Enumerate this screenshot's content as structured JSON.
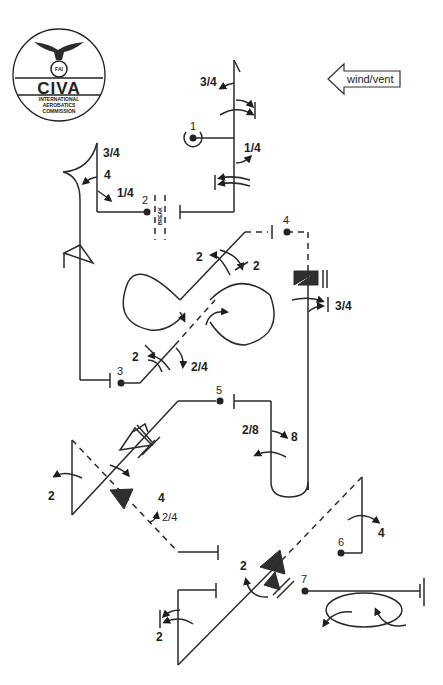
{
  "logo": {
    "title": "CIVA",
    "subtitle_lines": [
      "INTERNATIONAL",
      "AEROBATICS",
      "COMMISSION"
    ],
    "emblem": "FAI"
  },
  "wind_indicator": {
    "label": "wind/vent",
    "direction": "left"
  },
  "figures": [
    {
      "number": "1",
      "rolls": [
        "3/4",
        "1/4"
      ]
    },
    {
      "number": "2",
      "rolls": [
        "3/4",
        "4",
        "1/4"
      ],
      "break_label": "BREAK"
    },
    {
      "number": "3",
      "rolls": [
        "2",
        "2",
        "2",
        "2/4"
      ]
    },
    {
      "number": "4",
      "rolls": [
        "3/4"
      ]
    },
    {
      "number": "5",
      "rolls": [
        "2/8",
        "8"
      ]
    },
    {
      "number": "5b",
      "rolls": [
        "2",
        "4",
        "2/4"
      ]
    },
    {
      "number": "6",
      "rolls": [
        "4",
        "2",
        "2"
      ]
    },
    {
      "number": "7",
      "rolls": []
    }
  ],
  "labels": {
    "f1_num": "1",
    "f1_r1": "3/4",
    "f1_r2": "1/4",
    "f2_num": "2",
    "f2_r1": "3/4",
    "f2_r2": "4",
    "f2_r3": "1/4",
    "break": "BREAK",
    "f3_num": "3",
    "f3_r1": "2",
    "f3_r2": "2",
    "f3_r3": "2",
    "f3_r4": "2/4",
    "f4_num": "4",
    "f4_r1": "3/4",
    "f5_num": "5",
    "f5_r1": "2/8",
    "f5_r2": "8",
    "f5b_r1": "2",
    "f5b_r2": "4",
    "f5b_r3": "2/4",
    "f6_num": "6",
    "f6_r1": "4",
    "f6_r2": "2",
    "f6_r3": "2",
    "f7_num": "7"
  }
}
